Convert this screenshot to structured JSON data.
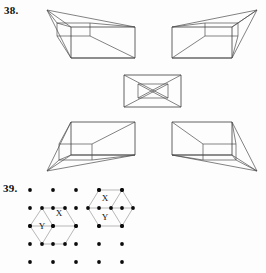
{
  "page": {
    "width": 266,
    "height": 273,
    "background": "#fdfdfd",
    "ink_color": "#3a3a3a",
    "grid_line_color": "#9a9a9a",
    "dot_color": "#0b0b0b"
  },
  "questions": [
    {
      "id": "q38",
      "number_label": "38.",
      "type": "spatial-reasoning-box-figures",
      "figure_count": 5,
      "arrangement": "cross (two top, one center, two bottom)",
      "figures": [
        {
          "name": "top-left-box",
          "position": "top-left",
          "description": "wireframe rectangular box in perspective, apex toward upper-left",
          "apex": "upper-left"
        },
        {
          "name": "top-right-box",
          "position": "top-right",
          "description": "wireframe rectangular box in perspective, apex toward upper-right",
          "apex": "upper-right"
        },
        {
          "name": "center-box",
          "position": "center",
          "description": "rectangle with smaller concentric rectangle joined by four corner diagonals",
          "apex": "none"
        },
        {
          "name": "bottom-left-box",
          "position": "bottom-left",
          "description": "wireframe rectangular box in perspective, apex toward lower-left",
          "apex": "lower-left"
        },
        {
          "name": "bottom-right-box",
          "position": "bottom-right",
          "description": "wireframe rectangular box in perspective, apex toward lower-right",
          "apex": "lower-right"
        }
      ]
    },
    {
      "id": "q39",
      "number_label": "39.",
      "type": "dot-grid-hexagon-figures",
      "grid": {
        "columns": 5,
        "rows": 5,
        "dot_radius": 1.9,
        "x_start": 30,
        "x_step": 23,
        "y_start": 190,
        "y_step": 18
      },
      "figures": [
        {
          "name": "left-hexagon-figure",
          "cell_labels": [
            "X",
            "Y"
          ],
          "label_positions": [
            {
              "text": "X",
              "x": 59,
              "y": 213
            },
            {
              "text": "Y",
              "x": 42,
              "y": 226
            }
          ]
        },
        {
          "name": "right-hexagon-figure",
          "cell_labels": [
            "X",
            "Y"
          ],
          "label_positions": [
            {
              "text": "X",
              "x": 106,
              "y": 199
            },
            {
              "text": "Y",
              "x": 106,
              "y": 220
            }
          ]
        }
      ]
    }
  ]
}
